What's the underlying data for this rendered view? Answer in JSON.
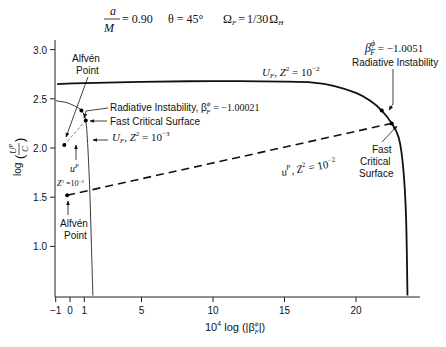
{
  "chart_data": {
    "type": "line",
    "title_params": {
      "spin": {
        "num": "a",
        "den": "M",
        "value": "= 0.90"
      },
      "theta": "θ = 45°",
      "omega": {
        "lhs": "Ω",
        "lhs_sub": "F",
        "eq": "=",
        "frac": "1/30",
        "rhs": "Ω",
        "rhs_sub": "H"
      }
    },
    "xlabel": {
      "prefix": "10",
      "exp": "4",
      "body": " log (|β",
      "sup": "ϕ",
      "sub": "F",
      "close": "|)"
    },
    "ylabel": {
      "text": "log",
      "num": "U",
      "num_sup": "P",
      "den": "C"
    },
    "xlim": [
      -1,
      24
    ],
    "ylim": [
      0.5,
      3.1
    ],
    "xticks": [
      -1,
      0,
      1,
      5,
      10,
      15,
      20
    ],
    "xtick_labels": [
      "−1",
      "0",
      "1",
      "5",
      "10",
      "15",
      "20"
    ],
    "yticks": [
      1.0,
      1.5,
      2.0,
      2.5,
      3.0
    ],
    "ytick_labels": [
      "1.0",
      "1.5",
      "2.0",
      "2.5",
      "3.0"
    ],
    "grid": false,
    "series": [
      {
        "name": "U_F, Z^2 = 10^-2",
        "style": "solid-thick",
        "points": [
          [
            -0.9,
            2.65
          ],
          [
            1,
            2.66
          ],
          [
            5,
            2.672
          ],
          [
            10,
            2.68
          ],
          [
            15,
            2.675
          ],
          [
            17,
            2.665
          ],
          [
            18.5,
            2.63
          ],
          [
            20,
            2.56
          ],
          [
            21,
            2.48
          ],
          [
            21.8,
            2.38
          ],
          [
            22.5,
            2.25
          ],
          [
            23.0,
            2.1
          ],
          [
            23.3,
            1.8
          ],
          [
            23.5,
            1.3
          ],
          [
            23.6,
            0.5
          ]
        ]
      },
      {
        "name": "u^P, Z^2 = 10^-2",
        "style": "dashed-thick",
        "points": [
          [
            -0.2,
            1.52
          ],
          [
            22.5,
            2.25
          ]
        ]
      },
      {
        "name": "U_F, Z^2 = 10^-3",
        "style": "solid-thin",
        "points": [
          [
            -1.0,
            2.48
          ],
          [
            -0.2,
            2.46
          ],
          [
            0.4,
            2.42
          ],
          [
            0.8,
            2.38
          ],
          [
            1.1,
            2.28
          ],
          [
            1.25,
            2.0
          ],
          [
            1.4,
            1.5
          ],
          [
            1.5,
            1.0
          ],
          [
            1.6,
            0.5
          ]
        ]
      },
      {
        "name": "u^P, Z^2 = 10^-3",
        "style": "dashed-thin",
        "points": [
          [
            -0.4,
            2.03
          ],
          [
            1.1,
            2.28
          ]
        ]
      }
    ],
    "markers": [
      {
        "name": "alfven-point-z3",
        "x": -0.4,
        "y": 2.03
      },
      {
        "name": "rad-instability-z3",
        "x": 0.8,
        "y": 2.38
      },
      {
        "name": "fast-critical-z3",
        "x": 1.1,
        "y": 2.28
      },
      {
        "name": "alfven-point-z2",
        "x": -0.2,
        "y": 1.52
      },
      {
        "name": "rad-instability-z2",
        "x": 21.8,
        "y": 2.38
      },
      {
        "name": "fast-critical-z2",
        "x": 22.5,
        "y": 2.25
      }
    ],
    "annotations": {
      "alfven_top": [
        "Alfvén",
        "Point"
      ],
      "alfven_bottom": [
        "Alfvén",
        "Point"
      ],
      "rad_inst_z3": {
        "text": "Radiative Instability, β",
        "sup": "ϕ",
        "sub": "F",
        "value": " = −1.00021"
      },
      "fast_crit_z3": "Fast Critical Surface",
      "uf_z3": {
        "U": "U",
        "sub": "F",
        "rest": ", Z",
        "sup2": "2",
        "eq": " = 10",
        "exp": "−3"
      },
      "up_z3": {
        "u": "u",
        "sup": "P",
        "z": "Z",
        "z_sup": "2",
        "eq": " =10",
        "exp": "−3"
      },
      "uf_z2": {
        "U": "U",
        "sub": "F",
        "rest": ", Z",
        "sup2": "2",
        "eq": " = 10",
        "exp": "−2"
      },
      "up_z2": {
        "u": "u",
        "sup": "P",
        "rest": ", Z",
        "sup2": "2",
        "eq": " = 10",
        "exp": "−2"
      },
      "beta_right": {
        "b": "β",
        "sup": "ϕ",
        "sub": "F",
        "value": " = −1.0051"
      },
      "rad_inst_right": "Radiative Instability",
      "fast_crit_right": [
        "Fast",
        "Critical",
        "Surface"
      ]
    }
  }
}
